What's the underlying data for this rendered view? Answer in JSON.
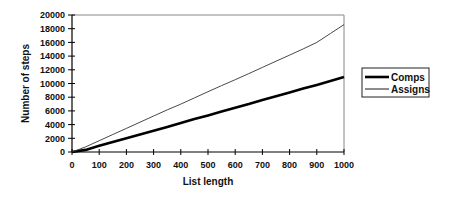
{
  "chart_data": {
    "type": "line",
    "title": "",
    "xlabel": "List length",
    "ylabel": "Number of steps",
    "xlim": [
      0,
      1000
    ],
    "ylim": [
      0,
      20000
    ],
    "xticks": [
      0,
      100,
      200,
      300,
      400,
      500,
      600,
      700,
      800,
      900,
      1000
    ],
    "yticks": [
      0,
      2000,
      4000,
      6000,
      8000,
      10000,
      12000,
      14000,
      16000,
      18000,
      20000
    ],
    "grid": false,
    "legend_position": "right",
    "x": [
      0,
      50,
      100,
      150,
      200,
      250,
      300,
      350,
      400,
      450,
      500,
      550,
      600,
      650,
      700,
      750,
      800,
      850,
      900,
      950,
      1000
    ],
    "series": [
      {
        "name": "Comps",
        "style": "thick",
        "values": [
          0,
          300,
          900,
          1450,
          2000,
          2550,
          3100,
          3650,
          4250,
          4800,
          5350,
          5900,
          6450,
          7000,
          7600,
          8150,
          8700,
          9250,
          9800,
          10350,
          10950
        ]
      },
      {
        "name": "Assigns",
        "style": "thin",
        "values": [
          0,
          750,
          1650,
          2550,
          3450,
          4350,
          5250,
          6150,
          7000,
          7900,
          8800,
          9700,
          10550,
          11450,
          12350,
          13250,
          14150,
          15050,
          16000,
          17300,
          18600
        ]
      }
    ]
  }
}
